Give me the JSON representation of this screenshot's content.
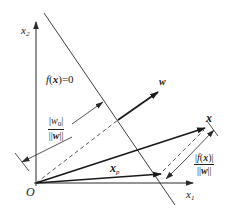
{
  "diagram": {
    "colors": {
      "line": "#2a2a2a",
      "background": "#ffffff"
    },
    "labels": {
      "x2_axis": "x",
      "x2_sub": "2",
      "x1_axis": "x",
      "x1_sub": "1",
      "origin": "O",
      "hyperplane": "f(x)=0",
      "hyperplane_f": "f",
      "hyperplane_open": "(",
      "hyperplane_x": "x",
      "hyperplane_close": ")=0",
      "w_vector": "w",
      "x_vector": "x",
      "xp_vector": "x",
      "xp_sub": "p",
      "w0_fraction": {
        "numerator_open": "|",
        "numerator_var": "w",
        "numerator_sub": "0",
        "numerator_close": "|",
        "denominator_open": "||",
        "denominator_var": "w",
        "denominator_close": "||"
      },
      "fx_fraction": {
        "numerator_open": "|",
        "numerator_f": "f",
        "numerator_paren_open": "(",
        "numerator_var": "x",
        "numerator_paren_close": ")|",
        "denominator_open": "||",
        "denominator_var": "w",
        "denominator_close": "||"
      }
    }
  }
}
